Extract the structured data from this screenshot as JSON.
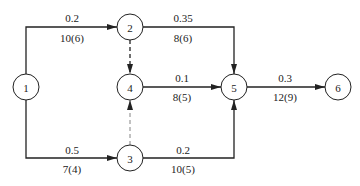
{
  "diagram": {
    "type": "activity-network",
    "nodes": [
      {
        "id": "1",
        "label": "1",
        "x": 26,
        "y": 87
      },
      {
        "id": "2",
        "label": "2",
        "x": 130,
        "y": 27
      },
      {
        "id": "3",
        "label": "3",
        "x": 130,
        "y": 158
      },
      {
        "id": "4",
        "label": "4",
        "x": 130,
        "y": 87
      },
      {
        "id": "5",
        "label": "5",
        "x": 234,
        "y": 87
      },
      {
        "id": "6",
        "label": "6",
        "x": 338,
        "y": 87
      }
    ],
    "edges": [
      {
        "from": "1",
        "to": "2",
        "top_label": "0.2",
        "bottom_label": "10(6)",
        "style": "solid"
      },
      {
        "from": "1",
        "to": "3",
        "top_label": "0.5",
        "bottom_label": "7(4)",
        "style": "solid"
      },
      {
        "from": "2",
        "to": "5",
        "top_label": "0.35",
        "bottom_label": "8(6)",
        "style": "solid"
      },
      {
        "from": "2",
        "to": "4",
        "top_label": "",
        "bottom_label": "",
        "style": "dashed"
      },
      {
        "from": "4",
        "to": "5",
        "top_label": "0.1",
        "bottom_label": "8(5)",
        "style": "solid"
      },
      {
        "from": "3",
        "to": "4",
        "top_label": "",
        "bottom_label": "",
        "style": "dashed-light"
      },
      {
        "from": "3",
        "to": "5",
        "top_label": "0.2",
        "bottom_label": "10(5)",
        "style": "solid"
      },
      {
        "from": "5",
        "to": "6",
        "top_label": "0.3",
        "bottom_label": "12(9)",
        "style": "solid"
      }
    ]
  }
}
